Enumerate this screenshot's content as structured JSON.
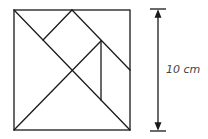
{
  "diagram": {
    "type": "tangram-square",
    "stroke_color": "#1a1a1a",
    "dimension_label": "10 cm",
    "pieces": [
      "large triangle (left)",
      "large triangle (bottom)",
      "medium triangle (top-right corner)",
      "small triangle (top-left corner)",
      "square",
      "small triangle (center-right)",
      "parallelogram (right)"
    ]
  }
}
